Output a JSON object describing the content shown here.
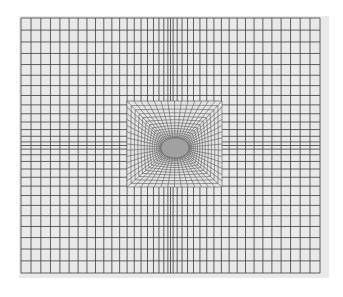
{
  "figure": {
    "kind": "finite-element-mesh",
    "colors": {
      "background": "#ffffff",
      "panel": "#e9e9e9",
      "grid_line": "#3c3c3c",
      "refined_line": "#555555",
      "hole_shade": "#6a6a6a"
    },
    "outer_mesh": {
      "columns": 40,
      "rows": 28,
      "grading": "denser toward center"
    },
    "refined_region": {
      "shape": "square",
      "radial_divisions": 14,
      "circumferential_divisions_per_side": 14,
      "center_feature": "circular hole"
    }
  }
}
